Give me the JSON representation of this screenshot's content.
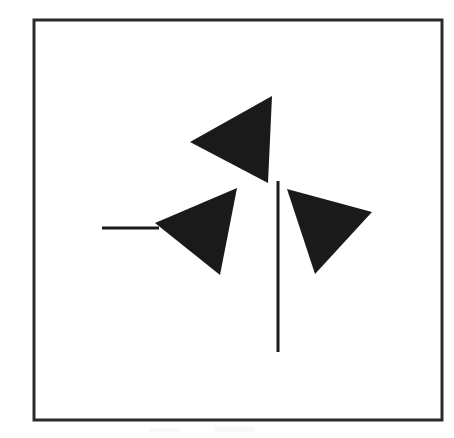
{
  "figure": {
    "background_color": "#ffffff",
    "ink_color": "#1a1a1a",
    "frame_color": "#2b2b2b",
    "canvas": {
      "width": 454,
      "height": 438
    },
    "frame": {
      "name": "outer-border",
      "x": 34,
      "y": 20,
      "width": 408,
      "height": 400,
      "stroke_width": 3,
      "fill": "none"
    },
    "shapes": [
      {
        "id": "triangle-top",
        "label": "Upper triangle pointing left",
        "type": "triangle",
        "fill": "#1a1a1a",
        "points": [
          {
            "x": 272,
            "y": 96
          },
          {
            "x": 190,
            "y": 142
          },
          {
            "x": 268,
            "y": 183
          }
        ]
      },
      {
        "id": "triangle-middle-left",
        "label": "Middle-left triangle pointing left",
        "type": "triangle",
        "fill": "#1a1a1a",
        "points": [
          {
            "x": 237,
            "y": 188
          },
          {
            "x": 155,
            "y": 223
          },
          {
            "x": 220,
            "y": 275
          }
        ]
      },
      {
        "id": "triangle-right",
        "label": "Right triangle pointing down",
        "type": "triangle",
        "fill": "#1a1a1a",
        "points": [
          {
            "x": 287,
            "y": 189
          },
          {
            "x": 372,
            "y": 212
          },
          {
            "x": 315,
            "y": 274
          }
        ]
      }
    ],
    "lines": [
      {
        "id": "line-horizontal",
        "label": "Short horizontal segment at left",
        "orientation": "horizontal",
        "x1": 102,
        "y1": 228,
        "x2": 159,
        "y2": 228,
        "stroke_width": 3,
        "stroke": "#1a1a1a",
        "length": 57
      },
      {
        "id": "line-vertical",
        "label": "Long vertical segment at center",
        "orientation": "vertical",
        "x1": 278,
        "y1": 181,
        "x2": 278,
        "y2": 352,
        "stroke_width": 3,
        "stroke": "#1a1a1a",
        "length": 171
      }
    ],
    "counts": {
      "triangles": 3,
      "line_segments": 2,
      "frames": 1
    }
  }
}
